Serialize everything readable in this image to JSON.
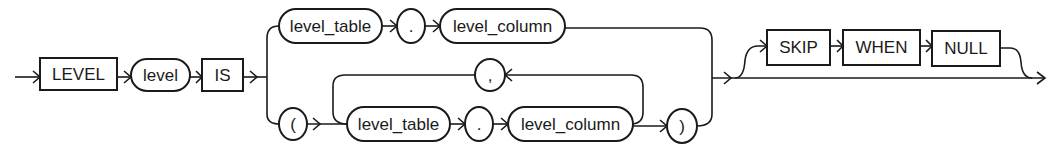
{
  "diagram": {
    "type": "railroad-syntax-diagram",
    "main_sequence": {
      "keyword_level": "LEVEL",
      "param_level": "level",
      "keyword_is": "IS"
    },
    "choice": {
      "option_single": {
        "level_table": "level_table",
        "dot": ".",
        "level_column": "level_column"
      },
      "option_list": {
        "open_paren": "(",
        "level_table": "level_table",
        "dot": ".",
        "level_column": "level_column",
        "separator": ",",
        "close_paren": ")"
      }
    },
    "optional_clause": {
      "skip": "SKIP",
      "when": "WHEN",
      "null": "NULL"
    }
  }
}
